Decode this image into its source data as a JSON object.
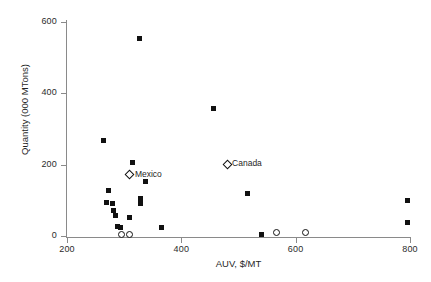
{
  "chart_data": {
    "type": "scatter",
    "title": "",
    "xlabel": "AUV, $/MT",
    "ylabel": "Quantity (000 MTons)",
    "xlim": [
      200,
      800
    ],
    "ylim": [
      0,
      600
    ],
    "xticks": [
      200,
      400,
      600,
      800
    ],
    "yticks": [
      0,
      200,
      400,
      600
    ],
    "grid": false,
    "legend": "none",
    "series": [
      {
        "name": "Suppliers",
        "marker": "filled-square",
        "points": [
          {
            "x": 264,
            "y": 267
          },
          {
            "x": 272,
            "y": 128
          },
          {
            "x": 269,
            "y": 94
          },
          {
            "x": 280,
            "y": 91
          },
          {
            "x": 282,
            "y": 72
          },
          {
            "x": 284,
            "y": 58
          },
          {
            "x": 288,
            "y": 27
          },
          {
            "x": 293,
            "y": 24
          },
          {
            "x": 310,
            "y": 52
          },
          {
            "x": 315,
            "y": 207
          },
          {
            "x": 326,
            "y": 555
          },
          {
            "x": 329,
            "y": 90
          },
          {
            "x": 329,
            "y": 104
          },
          {
            "x": 338,
            "y": 152
          },
          {
            "x": 366,
            "y": 25
          },
          {
            "x": 457,
            "y": 358
          },
          {
            "x": 515,
            "y": 118
          },
          {
            "x": 540,
            "y": 3
          },
          {
            "x": 796,
            "y": 100
          },
          {
            "x": 796,
            "y": 37
          }
        ]
      },
      {
        "name": "Open circle suppliers",
        "marker": "open-circle",
        "points": [
          {
            "x": 295,
            "y": 5
          },
          {
            "x": 309,
            "y": 5
          },
          {
            "x": 567,
            "y": 9
          },
          {
            "x": 618,
            "y": 10
          }
        ]
      },
      {
        "name": "Labeled countries",
        "marker": "open-diamond",
        "points": [
          {
            "x": 310,
            "y": 172,
            "label": "Mexico"
          },
          {
            "x": 480,
            "y": 201,
            "label": "Canada"
          }
        ]
      }
    ]
  },
  "colors": {
    "marker": "#111111",
    "axis": "#8a8a8a",
    "text": "#1f1f1f",
    "background": "#ffffff"
  }
}
